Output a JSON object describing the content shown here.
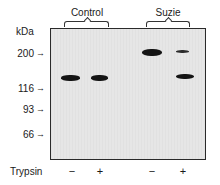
{
  "figure": {
    "groups": [
      {
        "label": "Control",
        "lanes": [
          0,
          1
        ]
      },
      {
        "label": "Suzie",
        "lanes": [
          2,
          3
        ]
      }
    ],
    "axis_unit": "kDa",
    "markers": [
      {
        "label": "200",
        "y": 54
      },
      {
        "label": "116",
        "y": 89
      },
      {
        "label": "93",
        "y": 110
      },
      {
        "label": "66",
        "y": 135
      }
    ],
    "treatment": {
      "label": "Trypsin",
      "lanes": [
        "−",
        "+",
        "−",
        "+"
      ]
    },
    "bands": [
      {
        "lane": 1,
        "group": "Control",
        "trypsin": "−",
        "approx_kDa": "~130",
        "intensity": "strong"
      },
      {
        "lane": 2,
        "group": "Control",
        "trypsin": "+",
        "approx_kDa": "~130",
        "intensity": "strong"
      },
      {
        "lane": 3,
        "group": "Suzie",
        "trypsin": "−",
        "approx_kDa": "~200",
        "intensity": "strong"
      },
      {
        "lane": 4,
        "group": "Suzie",
        "trypsin": "+",
        "approx_kDa": "~200",
        "intensity": "faint"
      },
      {
        "lane": 4,
        "group": "Suzie",
        "trypsin": "+",
        "approx_kDa": "~130",
        "intensity": "strong"
      }
    ],
    "arrow_glyph": "→"
  }
}
